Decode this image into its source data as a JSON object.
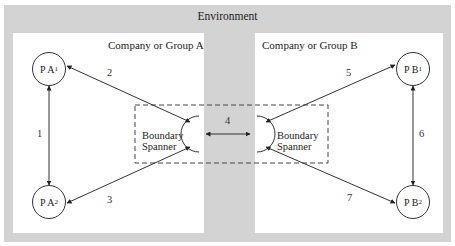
{
  "environment": {
    "title": "Environment",
    "background": "#d3d3d3"
  },
  "groups": [
    {
      "label": "Company or Group A"
    },
    {
      "label": "Company or Group B"
    }
  ],
  "nodes": {
    "pa1": {
      "label": "P A",
      "sub": "1"
    },
    "pa2": {
      "label": "P A",
      "sub": "2"
    },
    "pb1": {
      "label": "P B",
      "sub": "1"
    },
    "pb2": {
      "label": "P B",
      "sub": "2"
    }
  },
  "boundary_spanners": {
    "left": {
      "line1": "Boundary",
      "line2": "Spanner"
    },
    "right": {
      "line1": "Boundary",
      "line2": "Spanner"
    }
  },
  "links": [
    {
      "id": "1",
      "from": "P A1",
      "to": "P A2"
    },
    {
      "id": "2",
      "from": "P A1",
      "to": "Boundary Spanner A"
    },
    {
      "id": "3",
      "from": "P A2",
      "to": "Boundary Spanner A"
    },
    {
      "id": "4",
      "from": "Boundary Spanner A",
      "to": "Boundary Spanner B"
    },
    {
      "id": "5",
      "from": "Boundary Spanner B",
      "to": "P B1"
    },
    {
      "id": "6",
      "from": "P B1",
      "to": "P B2"
    },
    {
      "id": "7",
      "from": "Boundary Spanner B",
      "to": "P B2"
    }
  ]
}
